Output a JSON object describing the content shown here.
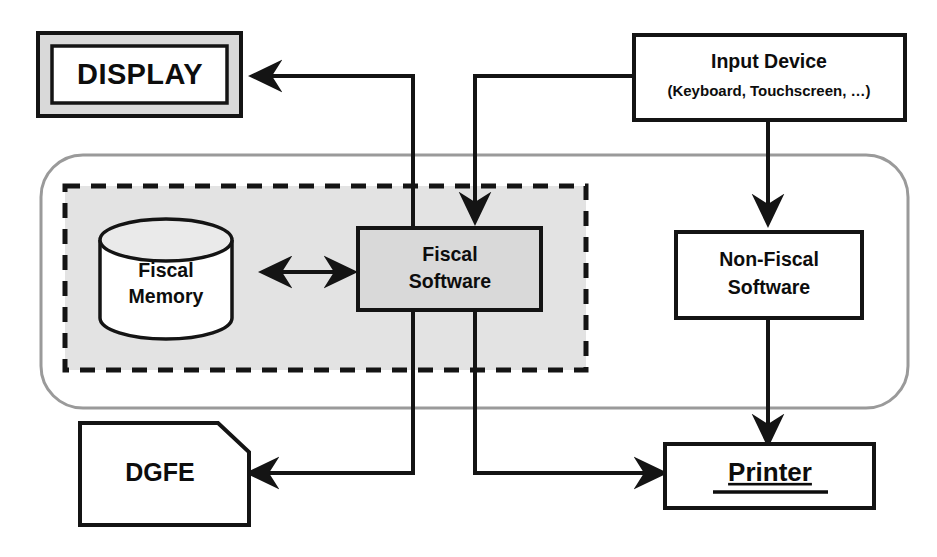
{
  "diagram": {
    "colors": {
      "line": "#141414",
      "secure_area_fill": "#e3e3e3",
      "outer_device_stroke": "#9a9a9a",
      "display_bezel_fill": "#d9d9d9",
      "node_fill_white": "#ffffff"
    },
    "nodes": {
      "display": {
        "label": "DISPLAY",
        "shape": "display-bezel-rectangle"
      },
      "input_device": {
        "label": "Input Device",
        "sublabel": "(Keyboard, Touchscreen, …)",
        "shape": "rectangle"
      },
      "fiscal_memory": {
        "label_line1": "Fiscal",
        "label_line2": "Memory",
        "shape": "cylinder"
      },
      "fiscal_software": {
        "label_line1": "Fiscal",
        "label_line2": "Software",
        "shape": "rectangle"
      },
      "non_fiscal_software": {
        "label_line1": "Non-Fiscal",
        "label_line2": "Software",
        "shape": "rectangle"
      },
      "dgfe": {
        "label": "DGFE",
        "shape": "document-clipped-corner"
      },
      "printer": {
        "label": "Printer",
        "shape": "rectangle"
      }
    },
    "regions": {
      "secure_fiscal_area": {
        "name": "fiscal secure area",
        "style": "dashed"
      },
      "device_enclosure": {
        "name": "device enclosure",
        "style": "rounded-solid"
      }
    },
    "connections": [
      {
        "id": "fiscal-software-to-display",
        "from": "fiscal_software",
        "to": "display",
        "arrow": "single"
      },
      {
        "id": "input-device-to-fiscal-software",
        "from": "input_device",
        "to": "fiscal_software",
        "arrow": "single"
      },
      {
        "id": "input-device-to-non-fiscal",
        "from": "input_device",
        "to": "non_fiscal_software",
        "arrow": "single"
      },
      {
        "id": "fiscal-memory-to-fiscal-software",
        "from": "fiscal_memory",
        "to": "fiscal_software",
        "arrow": "double"
      },
      {
        "id": "fiscal-software-to-dgfe",
        "from": "fiscal_software",
        "to": "dgfe",
        "arrow": "single"
      },
      {
        "id": "fiscal-software-to-printer",
        "from": "fiscal_software",
        "to": "printer",
        "arrow": "single"
      },
      {
        "id": "non-fiscal-software-to-printer",
        "from": "non_fiscal_software",
        "to": "printer",
        "arrow": "single"
      }
    ]
  }
}
